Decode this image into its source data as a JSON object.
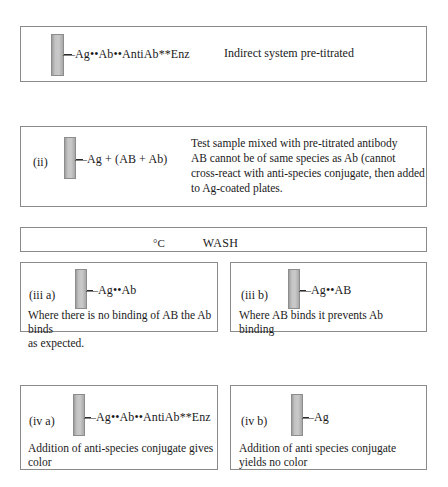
{
  "figure": {
    "title_text_present": false,
    "background_color": "#ffffff",
    "well_color": "#c4c4c4",
    "border_color": "#8a8a8a"
  },
  "panels": {
    "p1": {
      "name": "indirect-system-panel",
      "step_label": "",
      "formula": "—Ag••Ab••AntiAb**Enz",
      "note": "Indirect system pre-titrated",
      "caption": ""
    },
    "p2": {
      "name": "test-sample-panel",
      "step_label": "(ii)",
      "formula": "—Ag + (AB + Ab)",
      "note_lines": [
        "Test sample mixed with pre-titrated antibody",
        "AB cannot be of same species as Ab (cannot",
        "cross-react with anti-species conjugate, then added",
        "to Ag-coated plates."
      ]
    },
    "wash": {
      "name": "wash-step-bar",
      "temperature": "°C",
      "action": "WASH"
    },
    "p3a": {
      "name": "no-binding-panel",
      "step_label": "(iii a)",
      "formula": "—Ag••Ab",
      "caption_lines": [
        "Where there is no binding of AB the Ab binds",
        "as expected."
      ]
    },
    "p3b": {
      "name": "ab-blocked-panel",
      "step_label": "(iii b)",
      "formula": "—Ag••AB",
      "caption_lines": [
        "Where AB binds it prevents Ab",
        "binding"
      ]
    },
    "p4a": {
      "name": "color-development-panel",
      "step_label": "(iv a)",
      "formula": "—Ag••Ab••AntiAb**Enz",
      "caption_lines": [
        "Addition of anti-species conjugate gives",
        "color"
      ]
    },
    "p4b": {
      "name": "no-color-panel",
      "step_label": "(iv b)",
      "formula": "—Ag",
      "caption_lines": [
        "Addition of anti species conjugate",
        "yields  no color"
      ]
    }
  }
}
